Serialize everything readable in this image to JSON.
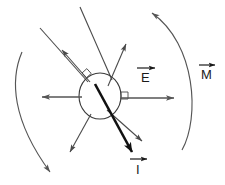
{
  "figure": {
    "background_color": "#ffffff",
    "width": 225,
    "height": 185
  },
  "colors": {
    "thin_line": "#4a4a4a",
    "mid_line": "#5a5a5a",
    "bold_line": "#111111",
    "circle_stroke": "#3a3a3a",
    "label_text": "#1a1a1a",
    "arc_stroke": "#55555 5"
  },
  "labels": [
    {
      "id": "label-E",
      "text": "E",
      "name": "vector-label-E",
      "x": 144,
      "y": 75,
      "overbar": true,
      "description": "electric-field vector label with overbar arrow"
    },
    {
      "id": "label-M",
      "text": "M",
      "name": "vector-label-M",
      "x": 205,
      "y": 78,
      "overbar": true,
      "description": "magnetization vector label with overbar arrow"
    },
    {
      "id": "label-I",
      "text": "I",
      "name": "vector-label-I",
      "x": 137,
      "y": 172,
      "overbar": true,
      "description": "current vector label with overbar arrow"
    }
  ],
  "central_body": {
    "name": "central-circle",
    "cx": 100,
    "cy": 96,
    "rx": 21,
    "ry": 23,
    "filled": false
  },
  "right_angle_marks": [
    {
      "name": "right-angle-mark-upper-left",
      "x": 84,
      "y": 73,
      "rotation": -40
    },
    {
      "name": "right-angle-mark-right",
      "x": 122,
      "y": 98,
      "rotation": 0
    }
  ],
  "arcs": [
    {
      "name": "rotation-arc-left",
      "path": "M 22,52 C 10,80 12,120 50,172",
      "arrow_at": "end",
      "description": "left curved rotation arc, arrowhead at bottom"
    },
    {
      "name": "rotation-arc-right",
      "path": "M 182,150 C 200,120 196,45 152,13",
      "arrow_at": "end",
      "description": "right curved rotation arc, arrowhead at top"
    }
  ],
  "rays": [
    {
      "name": "ray-incident-upper-left",
      "x1": 40,
      "y1": 28,
      "x2": 86,
      "y2": 80,
      "arrow": false,
      "weight": "thin"
    },
    {
      "name": "ray-incident-upper-mid",
      "x1": 80,
      "y1": 7,
      "x2": 110,
      "y2": 78,
      "arrow": false,
      "weight": "thin"
    },
    {
      "name": "ray-reflected-upper-left",
      "x1": 88,
      "y1": 80,
      "x2": 62,
      "y2": 50,
      "arrow": true,
      "weight": "thin"
    },
    {
      "name": "ray-reflected-upper-right",
      "x1": 108,
      "y1": 84,
      "x2": 125,
      "y2": 45,
      "arrow": true,
      "weight": "thin"
    },
    {
      "name": "ray-transmitted-lower-left",
      "x1": 90,
      "y1": 114,
      "x2": 70,
      "y2": 152,
      "arrow": true,
      "weight": "thin"
    },
    {
      "name": "ray-transmitted-lower-right",
      "x1": 108,
      "y1": 110,
      "x2": 140,
      "y2": 140,
      "arrow": true,
      "weight": "thin"
    },
    {
      "name": "ray-current-bold",
      "x1": 96,
      "y1": 86,
      "x2": 130,
      "y2": 150,
      "arrow": true,
      "weight": "bold"
    }
  ],
  "horizontal_arrows": [
    {
      "name": "field-arrow-left",
      "x1": 82,
      "y1": 97,
      "x2": 42,
      "y2": 97,
      "arrow": true
    },
    {
      "name": "field-arrow-right",
      "x1": 122,
      "y1": 98,
      "x2": 172,
      "y2": 98,
      "arrow": true
    }
  ]
}
